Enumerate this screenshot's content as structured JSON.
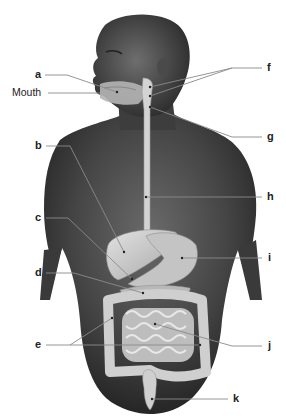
{
  "diagram": {
    "figure": "male-torso-with-digestive-organs",
    "colors": {
      "background": "#ffffff",
      "skin": "#3a3a3a",
      "organs": "#c9c9c9",
      "leader_lines": "#8a8a8a",
      "label_text": "#222222"
    },
    "labels": [
      {
        "id": "a",
        "text": "a",
        "side": "left"
      },
      {
        "id": "mouth",
        "text": "Mouth",
        "side": "left"
      },
      {
        "id": "b",
        "text": "b",
        "side": "left"
      },
      {
        "id": "c",
        "text": "c",
        "side": "left"
      },
      {
        "id": "d",
        "text": "d",
        "side": "left"
      },
      {
        "id": "e",
        "text": "e",
        "side": "left"
      },
      {
        "id": "f",
        "text": "f",
        "side": "right"
      },
      {
        "id": "g",
        "text": "g",
        "side": "right"
      },
      {
        "id": "h",
        "text": "h",
        "side": "right"
      },
      {
        "id": "i",
        "text": "i",
        "side": "right"
      },
      {
        "id": "j",
        "text": "j",
        "side": "right"
      },
      {
        "id": "k",
        "text": "k",
        "side": "right"
      }
    ]
  }
}
